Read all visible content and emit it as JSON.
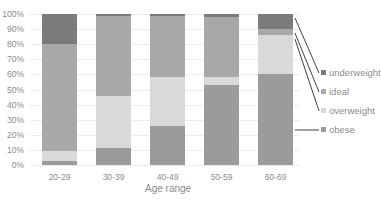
{
  "chart_data": {
    "type": "bar",
    "stacked": true,
    "normalized": true,
    "title": "",
    "xlabel": "Age range",
    "ylabel": "",
    "ylim": [
      0,
      100
    ],
    "yticks": [
      "0%",
      "10%",
      "20%",
      "30%",
      "40%",
      "50%",
      "60%",
      "70%",
      "80%",
      "90%",
      "100%"
    ],
    "grid": true,
    "legend_position": "right",
    "categories": [
      "20-29",
      "30-39",
      "40-49",
      "50-59",
      "60-69"
    ],
    "series": [
      {
        "name": "obese",
        "color": "#9b9b9b",
        "values": [
          2.5,
          11,
          26,
          53,
          60
        ]
      },
      {
        "name": "overweight",
        "color": "#d9d9d9",
        "values": [
          6.5,
          35,
          32,
          5,
          26
        ]
      },
      {
        "name": "ideal",
        "color": "#a8a8a8",
        "values": [
          71,
          53,
          40.5,
          40,
          4
        ]
      },
      {
        "name": "underweight",
        "color": "#7b7b7b",
        "values": [
          20,
          1,
          1.5,
          2,
          10
        ]
      }
    ],
    "legend": [
      "underweight",
      "ideal",
      "overweight",
      "obese"
    ]
  }
}
